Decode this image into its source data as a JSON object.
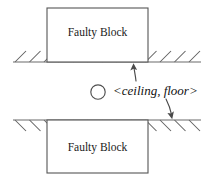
{
  "diagram": {
    "background_color": "#ffffff",
    "blocks": [
      {
        "id": "top-block",
        "label": "Faulty Block",
        "x": 47,
        "y": 8,
        "width": 101,
        "height": 54,
        "label_x": 97.5,
        "label_y": 33,
        "stroke_color": "#555555",
        "fill_color": "#ffffff"
      },
      {
        "id": "bottom-block",
        "label": "Faulty Block",
        "x": 47,
        "y": 120,
        "width": 101,
        "height": 53,
        "label_x": 97.5,
        "label_y": 148,
        "stroke_color": "#555555",
        "fill_color": "#ffffff"
      }
    ],
    "ground_lines": [
      {
        "id": "ceiling-line",
        "x1": 13,
        "x2": 201,
        "y": 62,
        "hatch_direction": "up",
        "color": "#6b6b6b"
      },
      {
        "id": "floor-line",
        "x1": 13,
        "x2": 201,
        "y": 120,
        "hatch_direction": "down",
        "color": "#6b6b6b"
      }
    ],
    "hatching": {
      "spacing": 14.5,
      "length": 11,
      "angle_deg": 45,
      "color": "#5f5f5f"
    },
    "annotation": {
      "bullet": {
        "id": "open-circle-bullet",
        "cx": 98,
        "cy": 92,
        "r": 7.2,
        "stroke_color": "#4f4f4f"
      },
      "label": "<ceiling, floor>",
      "label_x": 113,
      "label_y": 92,
      "color": "#111111"
    },
    "arrows": [
      {
        "id": "ceiling-arrow",
        "direction": "up",
        "from_x": 136,
        "from_y": 81,
        "to_x": 133.5,
        "to_y": 64,
        "target": "ceiling-line",
        "color": "#4a4a4a"
      },
      {
        "id": "floor-arrow",
        "direction": "down",
        "from_x": 166,
        "from_y": 99,
        "to_x": 172,
        "to_y": 118,
        "target": "floor-line",
        "color": "#4a4a4a"
      }
    ]
  }
}
